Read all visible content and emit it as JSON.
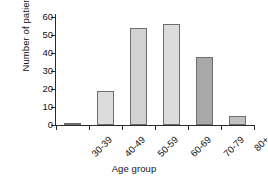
{
  "chart_data": {
    "type": "bar",
    "title": "",
    "subtitle": "",
    "xlabel": "Age group",
    "ylabel": "Number of patients",
    "categories": [
      "30-39",
      "40-49",
      "50-59",
      "60-69",
      "70-79",
      "80+"
    ],
    "values": [
      1,
      19,
      54,
      56,
      38,
      5
    ],
    "series": [
      {
        "name": "Number of patients",
        "values": [
          1,
          19,
          54,
          56,
          38,
          5
        ]
      }
    ],
    "bar_colors": [
      "#a8a8a8",
      "#dcdcdc",
      "#d2d2d2",
      "#dcdcdc",
      "#a8a8a8",
      "#c0c0c0"
    ],
    "bar_edge_color": "#6e6e6e",
    "ylim": [
      0,
      60
    ],
    "ytick_values": [
      0,
      10,
      20,
      30,
      40,
      50,
      60
    ],
    "ytick_labels": [
      "0",
      "10",
      "20",
      "30",
      "40",
      "50",
      "60"
    ],
    "grid": false,
    "legend": "none",
    "xtick_label_rotation": -45,
    "spines": [
      "left",
      "bottom"
    ],
    "background_color": "#ffffff",
    "axis_color": "#2b2b2b"
  }
}
